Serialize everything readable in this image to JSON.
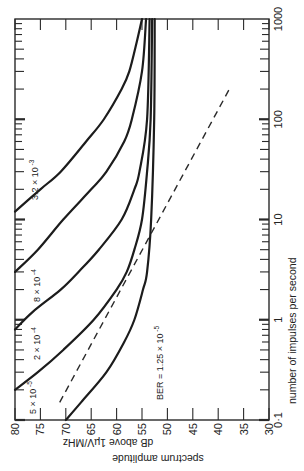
{
  "chart_data": {
    "type": "line",
    "orientation": "rotated-90-ccw",
    "title": "",
    "xlabel": "number of impulses per second",
    "ylabel": "spectrum amplitude dB above 1µV/MHz",
    "xscale": "log",
    "xlim": [
      0.1,
      1000
    ],
    "ylim": [
      30,
      80
    ],
    "x_ticks": [
      {
        "value": 0.1,
        "label": "0·1"
      },
      {
        "value": 1,
        "label": "1"
      },
      {
        "value": 10,
        "label": "10"
      },
      {
        "value": 100,
        "label": "100"
      },
      {
        "value": 1000,
        "label": "1000"
      }
    ],
    "y_ticks": [
      80,
      75,
      70,
      65,
      60,
      55,
      50,
      45,
      40,
      35,
      30
    ],
    "grid": false,
    "legend": "inline curve labels",
    "series": [
      {
        "name": "BER = 1.25×10⁻⁵",
        "label_main": "BER = 1.25 × 10",
        "label_exp": "-5",
        "style": "solid",
        "points": [
          [
            0.1,
            70
          ],
          [
            0.15,
            67
          ],
          [
            0.3,
            62
          ],
          [
            0.6,
            58.5
          ],
          [
            1,
            56.5
          ],
          [
            2,
            54.8
          ],
          [
            3,
            54
          ],
          [
            10,
            53.2
          ],
          [
            100,
            52.6
          ],
          [
            1000,
            52.5
          ]
        ]
      },
      {
        "name": "5×10⁻⁵",
        "label_main": "5 × 10",
        "label_exp": "-5",
        "style": "solid",
        "points": [
          [
            0.2,
            80
          ],
          [
            0.3,
            75.5
          ],
          [
            0.5,
            70.5
          ],
          [
            1,
            64.5
          ],
          [
            2,
            60
          ],
          [
            3,
            58
          ],
          [
            5,
            56.5
          ],
          [
            10,
            55
          ],
          [
            30,
            54
          ],
          [
            100,
            53.3
          ],
          [
            1000,
            53
          ]
        ]
      },
      {
        "name": "2×10⁻⁴",
        "label_main": "2 × 10",
        "label_exp": "-4",
        "style": "solid",
        "points": [
          [
            0.8,
            80
          ],
          [
            1.2,
            76.5
          ],
          [
            2,
            71
          ],
          [
            3,
            67.5
          ],
          [
            5,
            63.5
          ],
          [
            10,
            59
          ],
          [
            20,
            56.5
          ],
          [
            30,
            55.5
          ],
          [
            100,
            54
          ],
          [
            1000,
            53.5
          ]
        ]
      },
      {
        "name": "8×10⁻⁴",
        "label_main": "8 × 10",
        "label_exp": "-4",
        "style": "solid",
        "points": [
          [
            3,
            80
          ],
          [
            5,
            75.5
          ],
          [
            10,
            70.5
          ],
          [
            20,
            65
          ],
          [
            30,
            62
          ],
          [
            60,
            58.5
          ],
          [
            100,
            57
          ],
          [
            300,
            55
          ],
          [
            1000,
            54.2
          ]
        ]
      },
      {
        "name": "3.2×10⁻³",
        "label_main": "3.2 × 10",
        "label_exp": "-3",
        "style": "solid",
        "points": [
          [
            12,
            80
          ],
          [
            20,
            75
          ],
          [
            30,
            71
          ],
          [
            60,
            66
          ],
          [
            100,
            62.5
          ],
          [
            200,
            59
          ],
          [
            300,
            57.5
          ],
          [
            600,
            56
          ],
          [
            1000,
            55
          ]
        ]
      },
      {
        "name": "reference line",
        "style": "dashed",
        "points": [
          [
            0.15,
            71.2
          ],
          [
            200,
            37.8
          ]
        ]
      }
    ]
  },
  "labels": {
    "xlabel": "number of impulses per second",
    "ylabel_line1": "spectrum amplitude",
    "ylabel_line2": "dB above 1µV/MHz"
  }
}
